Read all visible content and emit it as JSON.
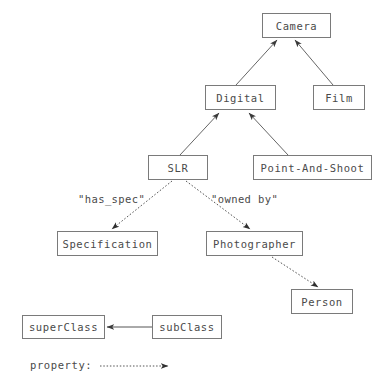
{
  "diagram": {
    "type": "uml-class-diagram",
    "background_color": "#ffffff",
    "box_border_color": "#7a7a7a",
    "text_color": "#4a4a4a",
    "edge_color": "#555555",
    "nodes": [
      {
        "id": "camera",
        "label": "Camera",
        "x": 262,
        "y": 13,
        "w": 69,
        "h": 25
      },
      {
        "id": "digital",
        "label": "Digital",
        "x": 205,
        "y": 85,
        "w": 71,
        "h": 25
      },
      {
        "id": "film",
        "label": "Film",
        "x": 313,
        "y": 85,
        "w": 52,
        "h": 25
      },
      {
        "id": "slr",
        "label": "SLR",
        "x": 148,
        "y": 155,
        "w": 60,
        "h": 25
      },
      {
        "id": "point-and-shoot",
        "label": "Point-And-Shoot",
        "x": 253,
        "y": 155,
        "w": 119,
        "h": 25
      },
      {
        "id": "specification",
        "label": "Specification",
        "x": 57,
        "y": 231,
        "w": 101,
        "h": 25
      },
      {
        "id": "photographer",
        "label": "Photographer",
        "x": 206,
        "y": 231,
        "w": 97,
        "h": 25
      },
      {
        "id": "person",
        "label": "Person",
        "x": 291,
        "y": 289,
        "w": 62,
        "h": 25
      }
    ],
    "edges": [
      {
        "id": "digital-to-camera",
        "from": "digital",
        "to": "camera",
        "style": "solid",
        "relation": "subClassOf",
        "label": ""
      },
      {
        "id": "film-to-camera",
        "from": "film",
        "to": "camera",
        "style": "solid",
        "relation": "subClassOf",
        "label": ""
      },
      {
        "id": "slr-to-digital",
        "from": "slr",
        "to": "digital",
        "style": "solid",
        "relation": "subClassOf",
        "label": ""
      },
      {
        "id": "point-and-shoot-to-digital",
        "from": "point-and-shoot",
        "to": "digital",
        "style": "solid",
        "relation": "subClassOf",
        "label": ""
      },
      {
        "id": "slr-has-spec",
        "from": "slr",
        "to": "specification",
        "style": "dotted",
        "relation": "property",
        "label": "\"has_spec\""
      },
      {
        "id": "slr-owned-by",
        "from": "slr",
        "to": "photographer",
        "style": "dotted",
        "relation": "property",
        "label": "\"owned by\""
      },
      {
        "id": "photographer-to-person",
        "from": "photographer",
        "to": "person",
        "style": "dotted",
        "relation": "property",
        "label": ""
      }
    ],
    "edge_labels": [
      {
        "id": "has-spec-label",
        "text": "\"has_spec\"",
        "x": 78,
        "y": 193
      },
      {
        "id": "owned-by-label",
        "text": "\"owned by\"",
        "x": 211,
        "y": 193
      }
    ]
  },
  "legend": {
    "superclass_label": "superClass",
    "subclass_label": "subClass",
    "property_label": "property:",
    "superclass_box": {
      "x": 22,
      "y": 315,
      "w": 83,
      "h": 24
    },
    "subclass_box": {
      "x": 152,
      "y": 315,
      "w": 70,
      "h": 24
    },
    "property_text_pos": {
      "x": 30,
      "y": 357
    },
    "property_arrow": {
      "x1": 100,
      "y1": 366,
      "x2": 168,
      "y2": 366
    }
  }
}
